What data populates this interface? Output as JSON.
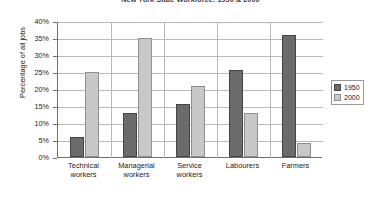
{
  "chart_data": {
    "type": "bar",
    "title": "New York State Workforce: 1950 & 2000",
    "xlabel": "",
    "ylabel": "Percentage of all jobs",
    "ylim": [
      0,
      40
    ],
    "ytick_labels": [
      "40%",
      "35%",
      "30%",
      "25%",
      "20%",
      "15%",
      "10%",
      "5%",
      "0%"
    ],
    "ytick_values": [
      40,
      35,
      30,
      25,
      20,
      15,
      10,
      5,
      0
    ],
    "grid": true,
    "legend_position": "right",
    "categories": [
      "Technical workers",
      "Managerial workers",
      "Service workers",
      "Labourers",
      "Farmers"
    ],
    "category_lines": [
      [
        "Technical",
        "workers"
      ],
      [
        "Managerial",
        "workers"
      ],
      [
        "Service",
        "workers"
      ],
      [
        "Labourers",
        ""
      ],
      [
        "Farmers",
        ""
      ]
    ],
    "series": [
      {
        "name": "1950",
        "color": "#6b6b6b",
        "values": [
          6,
          13,
          15.5,
          25.5,
          36
        ]
      },
      {
        "name": "2000",
        "color": "#c8c8c8",
        "values": [
          25,
          35,
          21,
          13,
          4
        ]
      }
    ]
  },
  "legend": {
    "entries": [
      {
        "label": "1950"
      },
      {
        "label": "2000"
      }
    ]
  }
}
